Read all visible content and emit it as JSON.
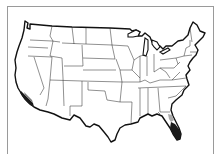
{
  "map": {
    "title": "United States",
    "region": "Contiguous United States",
    "highlighted_regions": [
      {
        "name": "Southern California coast",
        "shade": "dark"
      },
      {
        "name": "South Florida",
        "shade": "dark"
      }
    ],
    "colors": {
      "land": "#ffffff",
      "outline": "#111111",
      "state_border": "#222222",
      "highlight_dark": "#1a1a1a",
      "highlight_mid": "#7a7a7a",
      "frame_border": "#9a9a9a"
    }
  }
}
